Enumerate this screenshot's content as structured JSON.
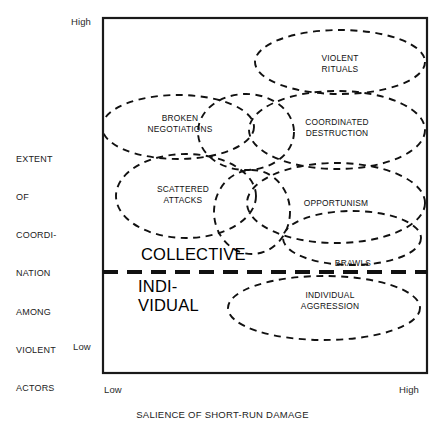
{
  "figure": {
    "frame": {
      "x": 103,
      "y": 18,
      "width": 324,
      "height": 355,
      "border_color": "#1a1a1a"
    }
  },
  "axes": {
    "y": {
      "title_lines": [
        "EXTENT",
        "OF",
        "COORDI-",
        "NATION",
        "AMONG",
        "VIOLENT",
        "ACTORS"
      ],
      "high_label": "High",
      "low_label": "Low"
    },
    "x": {
      "title": "SALIENCE OF SHORT-RUN DAMAGE",
      "low_label": "Low",
      "high_label": "High"
    }
  },
  "bands": [
    {
      "id": "collective",
      "label": "COLLECTIVE"
    },
    {
      "id": "individual",
      "label": "INDI-\nVIDUAL"
    }
  ],
  "divider": {
    "name": "collective-individual-divider",
    "y": 272,
    "style": "thick-dashed"
  },
  "regions": [
    {
      "id": "violent-rituals",
      "label": "VIOLENT\nRITUALS",
      "cx": 340,
      "cy": 62,
      "rx": 85,
      "ry": 32,
      "rot": 0,
      "label_x": 340,
      "label_y": 53
    },
    {
      "id": "broken-negotiations",
      "label": "BROKEN\nNEGOTIATIONS",
      "cx": 178,
      "cy": 127,
      "rx": 76,
      "ry": 32,
      "rot": 0,
      "label_x": 180,
      "label_y": 113
    },
    {
      "id": "coordinated-destruction",
      "label": "COORDINATED\nDESTRUCTION",
      "cx": 337,
      "cy": 130,
      "rx": 88,
      "ry": 39,
      "rot": 0,
      "label_x": 337,
      "label_y": 117
    },
    {
      "id": "scattered-attacks",
      "label": "SCATTERED\nATTACKS",
      "cx": 186,
      "cy": 196,
      "rx": 70,
      "ry": 42,
      "rot": 0,
      "label_x": 183,
      "label_y": 184
    },
    {
      "id": "opportunism",
      "label": "OPPORTUNISM",
      "cx": 336,
      "cy": 203,
      "rx": 89,
      "ry": 40,
      "rot": 0,
      "label_x": 336,
      "label_y": 198
    },
    {
      "id": "brawls",
      "label": "BRAWLS",
      "cx": 352,
      "cy": 238,
      "rx": 69,
      "ry": 27,
      "rot": 0,
      "label_x": 353,
      "label_y": 258
    },
    {
      "id": "individual-aggression",
      "label": "INDIVIDUAL\nAGGRESSION",
      "cx": 324,
      "cy": 308,
      "rx": 96,
      "ry": 32,
      "rot": 0,
      "label_x": 330,
      "label_y": 290
    },
    {
      "id": "bridge-upper",
      "label": "",
      "cx": 246,
      "cy": 132,
      "rx": 48,
      "ry": 38,
      "rot": 0,
      "label_x": 0,
      "label_y": 0
    },
    {
      "id": "bridge-lower",
      "label": "",
      "cx": 252,
      "cy": 212,
      "rx": 38,
      "ry": 42,
      "rot": 0,
      "label_x": 0,
      "label_y": 0
    }
  ],
  "style": {
    "stroke": "#111111",
    "ellipse_stroke_width": 1.9,
    "ellipse_dash": "7 5.5",
    "frame_stroke_width": 2.2,
    "divider_stroke_width": 4.2,
    "divider_dash": "15 9"
  }
}
